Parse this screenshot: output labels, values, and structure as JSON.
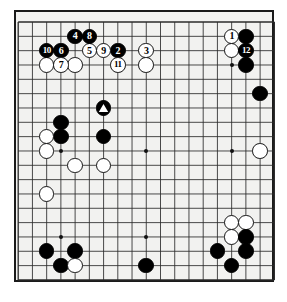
{
  "diagram": {
    "board_size": 19,
    "board_color": "#f2f2f0",
    "line_color": "#2b2b2b",
    "border_color": "#1a1a1a",
    "black_color": "#000000",
    "white_color": "#ffffff",
    "geometry": {
      "origin_x": 18.2,
      "origin_y": 22.0,
      "step_x": 14.23,
      "step_y": 14.33,
      "stone_diameter": 15.6,
      "frame_left": 14,
      "frame_top": 10,
      "frame_width": 260,
      "frame_height": 272
    },
    "star_points": [
      {
        "col": 3,
        "row": 3
      },
      {
        "col": 9,
        "row": 3
      },
      {
        "col": 15,
        "row": 3
      },
      {
        "col": 3,
        "row": 9
      },
      {
        "col": 9,
        "row": 9
      },
      {
        "col": 15,
        "row": 9
      },
      {
        "col": 3,
        "row": 15
      },
      {
        "col": 9,
        "row": 15
      },
      {
        "col": 15,
        "row": 15
      }
    ],
    "numbered_stones": [
      {
        "label": "1",
        "color": "white",
        "col": 15,
        "row": 1
      },
      {
        "label": "2",
        "color": "black",
        "col": 7,
        "row": 2
      },
      {
        "label": "3",
        "color": "white",
        "col": 9,
        "row": 2
      },
      {
        "label": "4",
        "color": "black",
        "col": 4,
        "row": 1
      },
      {
        "label": "5",
        "color": "white",
        "col": 5,
        "row": 2
      },
      {
        "label": "6",
        "color": "black",
        "col": 3,
        "row": 2
      },
      {
        "label": "7",
        "color": "white",
        "col": 3,
        "row": 3
      },
      {
        "label": "8",
        "color": "black",
        "col": 5,
        "row": 1
      },
      {
        "label": "9",
        "color": "white",
        "col": 6,
        "row": 2
      },
      {
        "label": "10",
        "color": "black",
        "col": 2,
        "row": 2
      },
      {
        "label": "11",
        "color": "white",
        "col": 7,
        "row": 3
      },
      {
        "label": "12",
        "color": "black",
        "col": 16,
        "row": 2
      }
    ],
    "plain_stones": [
      {
        "color": "white",
        "col": 2,
        "row": 3
      },
      {
        "color": "white",
        "col": 4,
        "row": 3
      },
      {
        "color": "white",
        "col": 9,
        "row": 3
      },
      {
        "color": "black",
        "col": 16,
        "row": 1
      },
      {
        "color": "white",
        "col": 15,
        "row": 2
      },
      {
        "color": "black",
        "col": 16,
        "row": 3
      },
      {
        "color": "black",
        "col": 17,
        "row": 5
      },
      {
        "color": "black",
        "col": 3,
        "row": 7
      },
      {
        "color": "black",
        "col": 3,
        "row": 8
      },
      {
        "color": "white",
        "col": 2,
        "row": 8
      },
      {
        "color": "white",
        "col": 2,
        "row": 9
      },
      {
        "color": "black",
        "col": 6,
        "row": 8
      },
      {
        "color": "white",
        "col": 4,
        "row": 10
      },
      {
        "color": "white",
        "col": 6,
        "row": 10
      },
      {
        "color": "white",
        "col": 17,
        "row": 9
      },
      {
        "color": "white",
        "col": 2,
        "row": 12
      },
      {
        "color": "white",
        "col": 15,
        "row": 14
      },
      {
        "color": "white",
        "col": 16,
        "row": 14
      },
      {
        "color": "white",
        "col": 15,
        "row": 15
      },
      {
        "color": "black",
        "col": 16,
        "row": 15
      },
      {
        "color": "black",
        "col": 14,
        "row": 16
      },
      {
        "color": "black",
        "col": 16,
        "row": 16
      },
      {
        "color": "black",
        "col": 15,
        "row": 17
      },
      {
        "color": "black",
        "col": 2,
        "row": 16
      },
      {
        "color": "black",
        "col": 4,
        "row": 16
      },
      {
        "color": "black",
        "col": 3,
        "row": 17
      },
      {
        "color": "white",
        "col": 4,
        "row": 17
      },
      {
        "color": "black",
        "col": 9,
        "row": 17
      }
    ],
    "marked_stones": [
      {
        "color": "black",
        "col": 6,
        "row": 6,
        "marker": "triangle"
      }
    ]
  }
}
